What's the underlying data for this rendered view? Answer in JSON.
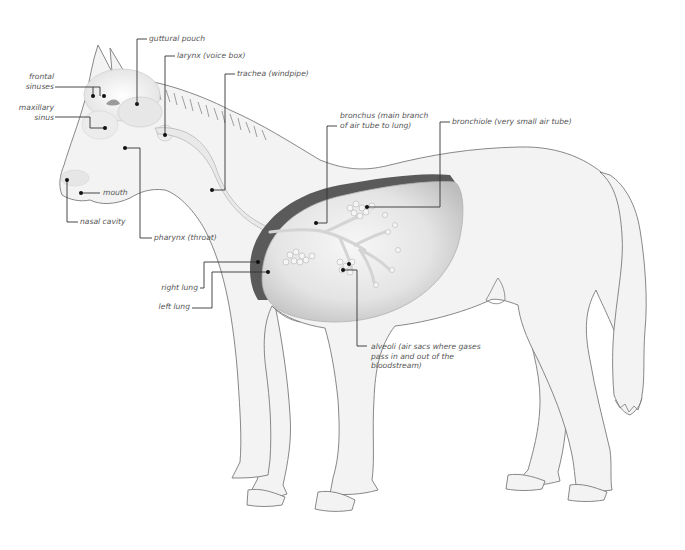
{
  "diagram": {
    "colors": {
      "body_fill": "#f3f3f3",
      "outline": "#7a7a7a",
      "left_lung": "#5a5a5a",
      "right_lung": "#d2d2d2",
      "label_text": "#555555",
      "leader_line": "#333333"
    },
    "labels": [
      {
        "id": "guttural-pouch",
        "text": "guttural pouch"
      },
      {
        "id": "larynx",
        "text": "larynx (voice box)"
      },
      {
        "id": "trachea",
        "text": "trachea (windpipe)"
      },
      {
        "id": "frontal-sinuses",
        "text": "frontal\nsinuses"
      },
      {
        "id": "maxillary-sinus",
        "text": "maxillary\nsinus"
      },
      {
        "id": "mouth",
        "text": "mouth"
      },
      {
        "id": "nasal-cavity",
        "text": "nasal cavity"
      },
      {
        "id": "pharynx",
        "text": "pharynx (throat)"
      },
      {
        "id": "bronchus",
        "text": "bronchus (main branch\nof air tube to lung)"
      },
      {
        "id": "bronchiole",
        "text": "bronchiole (very small air tube)"
      },
      {
        "id": "right-lung",
        "text": "right lung"
      },
      {
        "id": "left-lung",
        "text": "left lung"
      },
      {
        "id": "alveoli",
        "text": "alveoli (air sacs where gases\npass in and out of the\nbloodstream)"
      }
    ]
  }
}
